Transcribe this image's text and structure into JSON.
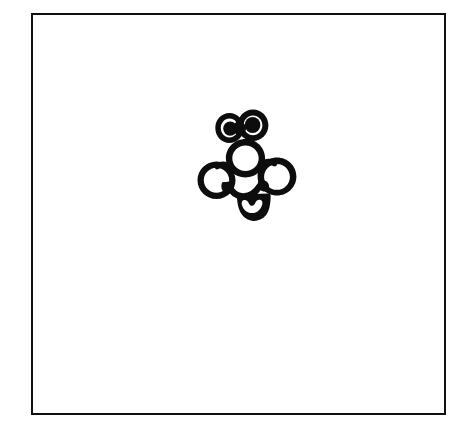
{
  "canvas": {
    "width": 464,
    "height": 430,
    "background_color": "#ffffff",
    "ink_color": "#0d0d0d",
    "description": "Scanned hand-drawn black ink doodle on white paper inside a thin rectangular border"
  },
  "frame": {
    "label": "Drawing border",
    "x": 31,
    "y": 13,
    "width": 415,
    "height": 402,
    "border_color": "#101010",
    "border_width": 2,
    "fill_color": "#ffffff"
  },
  "drawing": {
    "title": "Bug doodle",
    "subject": "cartoon bug / bee face with two eyes, wings and abdomen",
    "bounds": {
      "x": 200,
      "y": 110,
      "width": 100,
      "height": 110
    },
    "center": {
      "x": 250,
      "y": 165
    },
    "stroke_color": "#0d0d0d",
    "parts": [
      {
        "name": "left-eye",
        "cx": 229,
        "cy": 128,
        "r_outer": 13,
        "r_pupil": 7
      },
      {
        "name": "right-eye",
        "cx": 252,
        "cy": 125,
        "r_outer": 14,
        "r_pupil": 8
      },
      {
        "name": "head",
        "cx": 245,
        "cy": 158,
        "r": 18
      },
      {
        "name": "left-wing",
        "cx": 216,
        "cy": 180,
        "r": 17
      },
      {
        "name": "right-wing",
        "cx": 277,
        "cy": 176,
        "r": 17
      },
      {
        "name": "abdomen",
        "cx": 252,
        "cy": 207,
        "width": 30,
        "height": 26
      },
      {
        "name": "abdomen-notch",
        "cx": 252,
        "cy": 206,
        "r": 7
      }
    ]
  }
}
